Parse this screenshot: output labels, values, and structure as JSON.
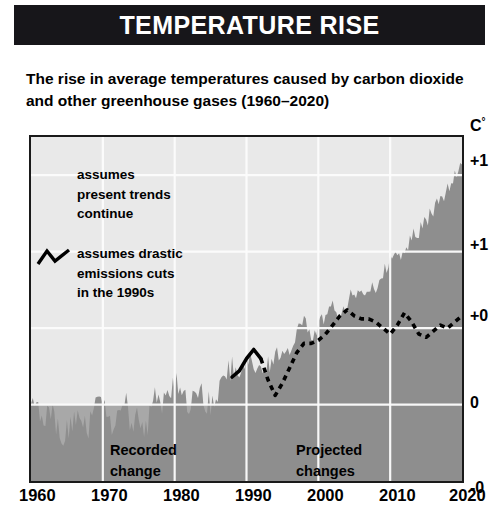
{
  "header": {
    "title": "TEMPERATURE RISE"
  },
  "subtitle": {
    "line1": "The rise in average temperatures caused by carbon dioxide",
    "line2": "and other greenhouse gases (1960–2020)"
  },
  "legend": {
    "series_a": {
      "line1": "assumes",
      "line2": "present trends",
      "line3": "continue"
    },
    "series_b": {
      "line1": "assumes drastic",
      "line2": "emissions cuts",
      "line3": "in the 1990s"
    },
    "glyph_name": "zigzag-line-icon"
  },
  "bands": {
    "recorded": {
      "line1": "Recorded",
      "line2": "change"
    },
    "projected": {
      "line1": "Projected",
      "line2": "changes"
    }
  },
  "axes": {
    "y_unit": "C",
    "y_unit_degree": "°",
    "y_ticks": [
      "+1",
      "+1",
      "+0",
      "0",
      "-0"
    ],
    "x_ticks": [
      "1960",
      "1970",
      "1980",
      "1990",
      "2000",
      "2010",
      "2020"
    ]
  },
  "colors": {
    "header_bg": "#17161a",
    "header_text": "#ffffff",
    "plot_bg": "#e9e9e9",
    "area_fill": "#8e8e8e",
    "below_zero_fill": "#a8a8a8",
    "gridline": "#fdfdfd",
    "axis_line": "#1a1a1a",
    "curve": "#000000"
  },
  "chart_data": {
    "type": "area",
    "title": "TEMPERATURE RISE",
    "subtitle": "The rise in average temperatures caused by carbon dioxide and other greenhouse gases (1960–2020)",
    "xlabel": "",
    "ylabel": "C°",
    "xlim": [
      1960,
      2020
    ],
    "ylim": [
      -0.5,
      1.75
    ],
    "grid": true,
    "x_ticks": [
      1960,
      1970,
      1980,
      1990,
      2000,
      2010,
      2020
    ],
    "y_ticks": [
      -0.5,
      0,
      0.5,
      1.0,
      1.5
    ],
    "y_tick_labels": [
      "-0",
      "0",
      "+0",
      "+1",
      "+1"
    ],
    "legend_position": "inside-top-left",
    "annotations": [
      "Recorded change",
      "Projected changes"
    ],
    "series": [
      {
        "name": "assumes present trends continue",
        "style": "filled-area",
        "x": [
          1960,
          1961,
          1962,
          1963,
          1964,
          1965,
          1966,
          1967,
          1968,
          1969,
          1970,
          1971,
          1972,
          1973,
          1974,
          1975,
          1976,
          1977,
          1978,
          1979,
          1980,
          1981,
          1982,
          1983,
          1984,
          1985,
          1986,
          1987,
          1988,
          1989,
          1990,
          1991,
          1992,
          1993,
          1994,
          1995,
          1996,
          1997,
          1998,
          1999,
          2000,
          2001,
          2002,
          2003,
          2004,
          2005,
          2006,
          2007,
          2008,
          2009,
          2010,
          2011,
          2012,
          2013,
          2014,
          2015,
          2016,
          2017,
          2018,
          2019,
          2020
        ],
        "values": [
          0.02,
          -0.04,
          -0.1,
          -0.05,
          -0.22,
          -0.18,
          -0.1,
          -0.14,
          -0.16,
          0.0,
          -0.02,
          -0.14,
          -0.1,
          0.04,
          -0.16,
          -0.1,
          -0.2,
          0.06,
          -0.06,
          0.06,
          0.12,
          0.1,
          -0.08,
          0.12,
          0.02,
          0.0,
          0.06,
          0.18,
          0.22,
          0.16,
          0.32,
          0.28,
          0.16,
          0.24,
          0.3,
          0.38,
          0.34,
          0.46,
          0.54,
          0.44,
          0.5,
          0.56,
          0.62,
          0.58,
          0.66,
          0.72,
          0.7,
          0.78,
          0.74,
          0.84,
          0.92,
          0.96,
          1.02,
          1.08,
          1.12,
          1.2,
          1.26,
          1.32,
          1.4,
          1.48,
          1.6
        ]
      },
      {
        "name": "assumes drastic emissions cuts in the 1990s",
        "style": "dashed-line",
        "solid_until": 1992,
        "x": [
          1988,
          1989,
          1990,
          1991,
          1992,
          1993,
          1994,
          1995,
          1996,
          1997,
          1998,
          1999,
          2000,
          2001,
          2002,
          2003,
          2004,
          2005,
          2006,
          2007,
          2008,
          2009,
          2010,
          2011,
          2012,
          2013,
          2014,
          2015,
          2016,
          2017,
          2018,
          2019,
          2020
        ],
        "values": [
          0.18,
          0.22,
          0.3,
          0.36,
          0.3,
          0.16,
          0.06,
          0.14,
          0.24,
          0.34,
          0.4,
          0.4,
          0.42,
          0.46,
          0.52,
          0.58,
          0.62,
          0.58,
          0.56,
          0.56,
          0.54,
          0.5,
          0.46,
          0.52,
          0.6,
          0.54,
          0.46,
          0.44,
          0.48,
          0.52,
          0.5,
          0.54,
          0.58
        ]
      }
    ]
  }
}
